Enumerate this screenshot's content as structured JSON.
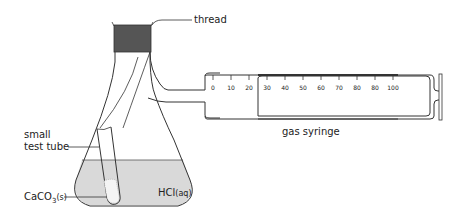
{
  "diagram": {
    "labels": {
      "thread": "thread",
      "small": "small",
      "test_tube": "test tube",
      "caco3_main": "CaCO",
      "caco3_sub": "3",
      "caco3_state": "(s)",
      "hcl_main": "HCl",
      "hcl_state": "(aq)",
      "gas_syringe": "gas syringe"
    },
    "syringe_scale": [
      "0",
      "10",
      "20",
      "30",
      "40",
      "50",
      "60",
      "70",
      "80",
      "80",
      "100"
    ],
    "colors": {
      "liquid": "#d9d9d9",
      "stopper": "#555555",
      "line": "#333333",
      "solid": "#f4f4f4"
    }
  }
}
